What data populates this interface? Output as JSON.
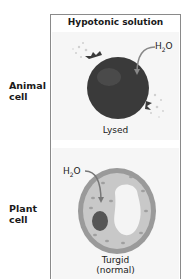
{
  "header": {
    "title": "Hypotonic solution"
  },
  "rows": [
    {
      "label_line1": "Animal",
      "label_line2": "cell",
      "solvent": "H",
      "solvent_sub": "2",
      "solvent_tail": "O",
      "state": "Lysed"
    },
    {
      "label_line1": "Plant",
      "label_line2": "cell",
      "solvent": "H",
      "solvent_sub": "2",
      "solvent_tail": "O",
      "state_line1": "Turgid",
      "state_line2": "(normal)"
    }
  ],
  "colors": {
    "animal_cell": "#3a3a3a",
    "plant_cell_wall": "#9a9a9a",
    "plant_cytoplasm": "#c8c8c8",
    "vacuole": "#f4f4f4",
    "nucleus": "#555555",
    "frame_border": "#8a8a8a"
  }
}
